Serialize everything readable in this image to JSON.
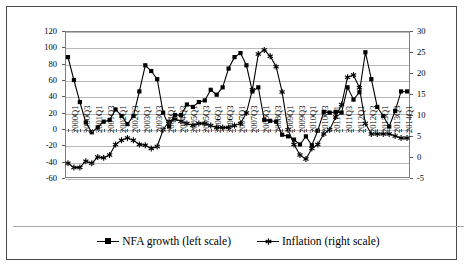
{
  "chart_data": {
    "type": "line",
    "title": "",
    "subtitle": "",
    "xlabel": "",
    "ylabel": "",
    "grid": true,
    "legend_position": "bottom",
    "x": [
      "2000Q1",
      "2000Q2",
      "2000Q3",
      "2000Q4",
      "2001Q1",
      "2001Q2",
      "2001Q3",
      "2001Q4",
      "2002Q1",
      "2002Q2",
      "2002Q3",
      "2002Q4",
      "2003Q1",
      "2003Q2",
      "2003Q3",
      "2003Q4",
      "2004Q1",
      "2004Q2",
      "2004Q3",
      "2004Q4",
      "2005Q1",
      "2005Q2",
      "2005Q3",
      "2005Q4",
      "2006Q1",
      "2006Q2",
      "2006Q3",
      "2006Q4",
      "2007Q1",
      "2007Q2",
      "2007Q3",
      "2007Q4",
      "2008Q1",
      "2008Q2",
      "2008Q3",
      "2008Q4",
      "2009Q1",
      "2009Q2",
      "2009Q3",
      "2009Q4",
      "2010Q1",
      "2010Q2",
      "2010Q3",
      "2010Q4",
      "2011Q1",
      "2011Q2",
      "2011Q3",
      "2011Q4",
      "2012Q1",
      "2012Q2",
      "2012Q3",
      "2012Q4",
      "2013Q1",
      "2013Q2",
      "2013Q3",
      "2013Q4",
      "2014Q1",
      "2014Q2"
    ],
    "xtick_labels": [
      "2000Q1",
      "2000Q3",
      "2001Q1",
      "2001Q3",
      "2002Q1",
      "2002Q3",
      "2003Q1",
      "2003Q3",
      "2004Q1",
      "2004Q3",
      "2005Q1",
      "2005Q3",
      "2006Q1",
      "2006Q3",
      "2007Q1",
      "2007Q3",
      "2008Q1",
      "2008Q3",
      "2009Q1",
      "2009Q3",
      "2010Q1",
      "2010Q3",
      "2011Q1",
      "2011Q3",
      "2012Q1",
      "2012Q3",
      "2013Q1",
      "2013Q3",
      "2014Q1"
    ],
    "axes": {
      "left": {
        "ticks": [
          120,
          100,
          80,
          60,
          40,
          20,
          0,
          -20,
          -40,
          -60
        ],
        "ylim": [
          -60,
          120
        ],
        "label": "NFA growth (left scale)"
      },
      "right": {
        "ticks": [
          30,
          25,
          20,
          15,
          10,
          5,
          0,
          -5
        ],
        "ylim": [
          -5,
          30
        ],
        "label": "Inflation (right scale)"
      }
    },
    "series": [
      {
        "name": "NFA growth (left scale)",
        "axis": "left",
        "marker": "square",
        "color": "#000000",
        "values": [
          88,
          60,
          33,
          8,
          -4,
          2,
          9,
          11,
          24,
          16,
          6,
          16,
          46,
          78,
          71,
          61,
          20,
          3,
          17,
          17,
          30,
          27,
          33,
          35,
          48,
          42,
          51,
          74,
          88,
          93,
          78,
          46,
          51,
          11,
          10,
          9,
          -7,
          -9,
          -13,
          -19,
          -9,
          -20,
          -2,
          21,
          20,
          21,
          20,
          51,
          36,
          45,
          94,
          61,
          27,
          16,
          3,
          22,
          46,
          46
        ]
      },
      {
        "name": "Inflation (right scale)",
        "axis": "right",
        "marker": "star",
        "color": "#000000",
        "values": [
          -1.5,
          -2.5,
          -2.5,
          -1.0,
          -1.5,
          0.0,
          -0.2,
          0.5,
          3.0,
          4.0,
          4.5,
          4.0,
          3.0,
          2.8,
          2.0,
          2.5,
          6.5,
          8.5,
          9.0,
          8.5,
          8.0,
          7.5,
          8.0,
          8.0,
          7.5,
          7.0,
          7.0,
          7.0,
          7.5,
          8.0,
          10.5,
          16.0,
          24.5,
          25.5,
          24.0,
          21.5,
          15.5,
          6.5,
          3.0,
          0.5,
          -0.5,
          2.0,
          3.0,
          5.5,
          6.5,
          9.5,
          12.5,
          19.0,
          19.5,
          16.5,
          8.0,
          5.5,
          5.5,
          5.5,
          5.5,
          5.0,
          4.5,
          4.5
        ]
      }
    ]
  },
  "legend": {
    "items": [
      {
        "label": "NFA growth (left scale)",
        "marker": "square"
      },
      {
        "label": "Inflation (right scale)",
        "marker": "star"
      }
    ]
  }
}
